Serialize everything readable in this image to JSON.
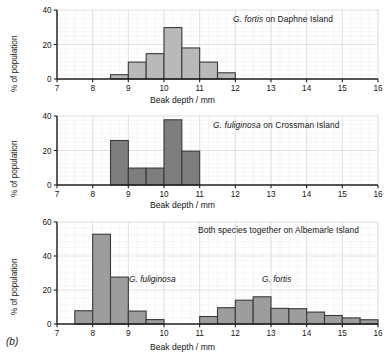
{
  "figure": {
    "label": "(b)",
    "axis_x_title": "Beak depth / mm",
    "axis_y_title": "% of population"
  },
  "chart_data": [
    {
      "type": "bar",
      "title": "G. fortis on Daphne Island",
      "title_species": "G. fortis",
      "title_rest": " on Daphne Island",
      "xlabel": "Beak depth / mm",
      "ylabel": "% of population",
      "xlim": [
        7,
        16
      ],
      "ylim": [
        0,
        40
      ],
      "xticks": [
        7,
        8,
        9,
        10,
        11,
        12,
        13,
        14,
        15,
        16
      ],
      "yticks": [
        0,
        20,
        40
      ],
      "bin_width": 0.5,
      "grid": true,
      "bar_fill": "#b9b9b9",
      "bar_edge": "#3a3a3a",
      "bins": [
        {
          "x0": 8.5,
          "x1": 9.0,
          "value": 2.5
        },
        {
          "x0": 9.0,
          "x1": 9.5,
          "value": 9.8
        },
        {
          "x0": 9.5,
          "x1": 10.0,
          "value": 14.7
        },
        {
          "x0": 10.0,
          "x1": 10.5,
          "value": 29.8
        },
        {
          "x0": 10.5,
          "x1": 11.0,
          "value": 18.0
        },
        {
          "x0": 11.0,
          "x1": 11.5,
          "value": 9.8
        },
        {
          "x0": 11.5,
          "x1": 12.0,
          "value": 3.6
        }
      ]
    },
    {
      "type": "bar",
      "title": "G. fuliginosa on Crossman Island",
      "title_species": "G. fuliginosa",
      "title_rest": " on Crossman Island",
      "xlabel": "Beak depth / mm",
      "ylabel": "% of population",
      "xlim": [
        7,
        16
      ],
      "ylim": [
        0,
        40
      ],
      "xticks": [
        7,
        8,
        9,
        10,
        11,
        12,
        13,
        14,
        15,
        16
      ],
      "yticks": [
        0,
        20,
        40
      ],
      "bin_width": 0.5,
      "grid": true,
      "bar_fill": "#7e7e7e",
      "bar_edge": "#3a3a3a",
      "bins": [
        {
          "x0": 8.5,
          "x1": 9.0,
          "value": 25.8
        },
        {
          "x0": 9.0,
          "x1": 9.5,
          "value": 9.8
        },
        {
          "x0": 9.5,
          "x1": 10.0,
          "value": 9.8
        },
        {
          "x0": 10.0,
          "x1": 10.5,
          "value": 37.8
        },
        {
          "x0": 10.5,
          "x1": 11.0,
          "value": 19.6
        }
      ]
    },
    {
      "type": "bar",
      "title": "Both species together on Albemarle Island",
      "title_species": "",
      "title_rest": "Both species together on Albemarle Island",
      "xlabel": "Beak depth / mm",
      "ylabel": "% of population",
      "xlim": [
        7,
        16
      ],
      "ylim": [
        0,
        60
      ],
      "xticks": [
        7,
        8,
        9,
        10,
        11,
        12,
        13,
        14,
        15,
        16
      ],
      "yticks": [
        0,
        20,
        40,
        60
      ],
      "bin_width": 0.5,
      "grid": true,
      "bar_fill": "#9d9d9d",
      "bar_edge": "#3a3a3a",
      "annotations": [
        {
          "text": "G. fuliginosa",
          "x": 9.35,
          "y": 23
        },
        {
          "text": "G. fortis",
          "x": 13.0,
          "y": 23
        }
      ],
      "bins": [
        {
          "x0": 7.5,
          "x1": 8.0,
          "value": 7.8
        },
        {
          "x0": 8.0,
          "x1": 8.5,
          "value": 52.8
        },
        {
          "x0": 8.5,
          "x1": 9.0,
          "value": 27.6
        },
        {
          "x0": 9.0,
          "x1": 9.5,
          "value": 7.6
        },
        {
          "x0": 9.5,
          "x1": 10.0,
          "value": 2.6
        },
        {
          "x0": 11.0,
          "x1": 11.5,
          "value": 4.4
        },
        {
          "x0": 11.5,
          "x1": 12.0,
          "value": 9.6
        },
        {
          "x0": 12.0,
          "x1": 12.5,
          "value": 14.0
        },
        {
          "x0": 12.5,
          "x1": 13.0,
          "value": 16.0
        },
        {
          "x0": 13.0,
          "x1": 13.5,
          "value": 9.2
        },
        {
          "x0": 13.5,
          "x1": 14.0,
          "value": 9.0
        },
        {
          "x0": 14.0,
          "x1": 14.5,
          "value": 7.0
        },
        {
          "x0": 14.5,
          "x1": 15.0,
          "value": 5.0
        },
        {
          "x0": 15.0,
          "x1": 15.5,
          "value": 3.6
        },
        {
          "x0": 15.5,
          "x1": 16.0,
          "value": 2.5
        }
      ]
    }
  ]
}
